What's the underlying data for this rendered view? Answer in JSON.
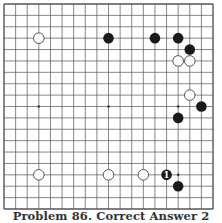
{
  "caption": "Problem 86. Correct Answer 2",
  "board": {
    "size": 19,
    "star_points": [
      [
        3,
        3
      ],
      [
        9,
        3
      ],
      [
        15,
        3
      ],
      [
        3,
        9
      ],
      [
        9,
        9
      ],
      [
        15,
        9
      ],
      [
        3,
        15
      ],
      [
        9,
        15
      ],
      [
        15,
        15
      ]
    ],
    "stones": [
      {
        "color": "white",
        "col": 3,
        "row": 3
      },
      {
        "color": "black",
        "col": 9,
        "row": 3
      },
      {
        "color": "black",
        "col": 13,
        "row": 3
      },
      {
        "color": "black",
        "col": 15,
        "row": 3
      },
      {
        "color": "black",
        "col": 16,
        "row": 4
      },
      {
        "color": "white",
        "col": 15,
        "row": 5
      },
      {
        "color": "white",
        "col": 16,
        "row": 5
      },
      {
        "color": "white",
        "col": 16,
        "row": 8
      },
      {
        "color": "black",
        "col": 17,
        "row": 9
      },
      {
        "color": "black",
        "col": 15,
        "row": 10
      },
      {
        "color": "white",
        "col": 3,
        "row": 15
      },
      {
        "color": "white",
        "col": 9,
        "row": 15
      },
      {
        "color": "white",
        "col": 12,
        "row": 15
      },
      {
        "color": "black",
        "col": 14,
        "row": 15,
        "label": "1"
      },
      {
        "color": "black",
        "col": 15,
        "row": 16
      }
    ]
  },
  "colors": {
    "line": "#555555",
    "black_stone": "#1a1a1a",
    "white_stone": "#ffffff",
    "label_on_black": "#ffffff"
  }
}
